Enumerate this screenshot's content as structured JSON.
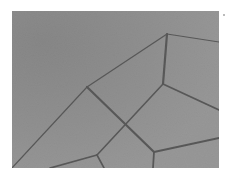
{
  "image": {
    "subject": "grayscale micrograph of polycrystalline grain boundaries",
    "colors": {
      "background": "#8c8c8c",
      "background_dark": "#7e7e7e",
      "grain_light": "#979797",
      "boundary": "#383838",
      "frame": "#ffffff"
    },
    "boundaries": [
      {
        "from": [
          0,
          157
        ],
        "to": [
          75,
          76
        ],
        "width": 1.2
      },
      {
        "from": [
          75,
          76
        ],
        "to": [
          155,
          23
        ],
        "width": 1.3
      },
      {
        "from": [
          155,
          23
        ],
        "to": [
          207,
          31
        ],
        "width": 1.2
      },
      {
        "from": [
          155,
          23
        ],
        "to": [
          151,
          73
        ],
        "width": 2.2
      },
      {
        "from": [
          151,
          73
        ],
        "to": [
          207,
          99
        ],
        "width": 1.8
      },
      {
        "from": [
          151,
          73
        ],
        "to": [
          85,
          144
        ],
        "width": 1.6
      },
      {
        "from": [
          75,
          76
        ],
        "to": [
          142,
          141
        ],
        "width": 2.2
      },
      {
        "from": [
          142,
          141
        ],
        "to": [
          207,
          127
        ],
        "width": 1.8
      },
      {
        "from": [
          142,
          141
        ],
        "to": [
          141,
          157
        ],
        "width": 1.8
      },
      {
        "from": [
          85,
          144
        ],
        "to": [
          38,
          157
        ],
        "width": 1.8
      },
      {
        "from": [
          85,
          144
        ],
        "to": [
          92,
          157
        ],
        "width": 1.6
      }
    ]
  }
}
